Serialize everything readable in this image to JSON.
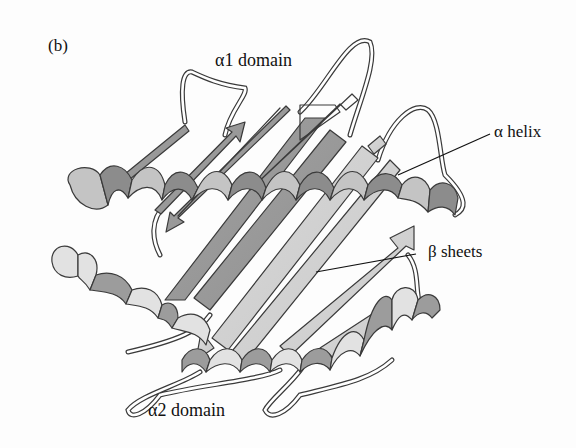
{
  "figure": {
    "panel_label": "(b)",
    "colors": {
      "background": "#fdfdfd",
      "outline": "#3a3a3a",
      "strand_dark": "#9a9a9a",
      "strand_light": "#d4d4d4",
      "helix_light": "#c8c8c8",
      "helix_dark": "#8c8c8c",
      "loop": "#ffffff"
    }
  },
  "labels": {
    "alpha1_domain": "α1 domain",
    "alpha_helix": "α helix",
    "beta_sheets": "β sheets",
    "alpha2_domain": "α2 domain"
  },
  "elements": [
    {
      "type": "alpha-helix",
      "domain": "α1",
      "position": "upper"
    },
    {
      "type": "alpha-helix",
      "domain": "α2",
      "position": "lower"
    },
    {
      "type": "beta-sheet",
      "strands": 8,
      "position": "floor"
    },
    {
      "type": "loop",
      "count": 6
    }
  ]
}
